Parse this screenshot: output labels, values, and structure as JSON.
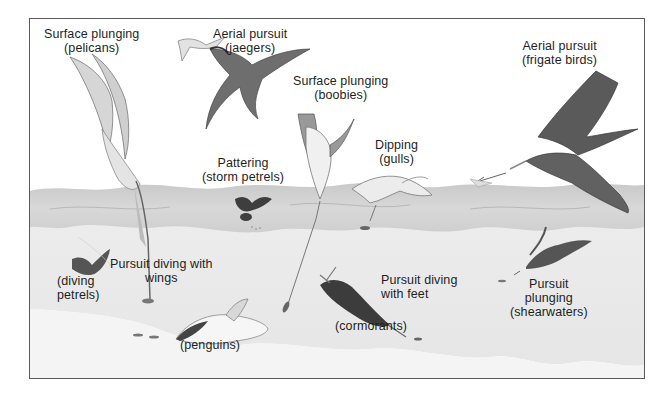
{
  "figure": {
    "colors": {
      "frame_border": "#5a5a5a",
      "sky": "#ffffff",
      "water_surface": "#d4d4d4",
      "water_deep": "#ebebeb",
      "bird_dark": "#4a4a4a",
      "text": "#1e1e1e"
    },
    "labels": [
      {
        "id": "pelicans",
        "method": "Surface plunging",
        "group": "(pelicans)"
      },
      {
        "id": "jaegers",
        "method": "Aerial pursuit",
        "group": "(jaegers)"
      },
      {
        "id": "boobies",
        "method": "Surface plunging",
        "group": "(boobies)"
      },
      {
        "id": "frigatebirds",
        "method": "Aerial pursuit",
        "group": "(frigate birds)"
      },
      {
        "id": "storm_petrels",
        "method": "Pattering",
        "group": "(storm petrels)"
      },
      {
        "id": "gulls",
        "method": "Dipping",
        "group": "(gulls)"
      },
      {
        "id": "wings",
        "method": "Pursuit diving with",
        "group": "wings"
      },
      {
        "id": "diving_petrels",
        "method": "(diving",
        "group": "petrels)"
      },
      {
        "id": "penguins",
        "method": "",
        "group": "(penguins)"
      },
      {
        "id": "feet",
        "method": "Pursuit diving",
        "group": "with feet"
      },
      {
        "id": "cormorants",
        "method": "",
        "group": "(cormorants)"
      },
      {
        "id": "shearwaters_1",
        "method": "Pursuit",
        "group": "plunging"
      },
      {
        "id": "shearwaters_2",
        "method": "",
        "group": "(shearwaters)"
      }
    ],
    "birds": [
      "pelican-icon",
      "jaeger-icon",
      "tern-icon",
      "booby-icon",
      "frigatebird-icon",
      "storm-petrel-icon",
      "gull-icon",
      "diving-petrel-icon",
      "penguin-icon",
      "cormorant-icon",
      "shearwater-icon"
    ]
  }
}
